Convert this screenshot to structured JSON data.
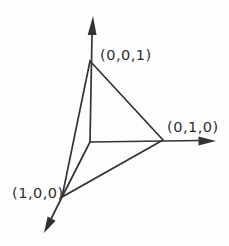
{
  "figure": {
    "background_color": "#fdfdfd",
    "line_color": "#333333",
    "points": [
      {
        "label": "(0,0,1)",
        "coords": [
          0,
          0,
          1
        ],
        "position": "top-vertex"
      },
      {
        "label": "(0,1,0)",
        "coords": [
          0,
          1,
          0
        ],
        "position": "right-vertex"
      },
      {
        "label": "(1,0,0)",
        "coords": [
          1,
          0,
          0
        ],
        "position": "bottom-left-vertex"
      }
    ],
    "axes": [
      {
        "name": "z-axis",
        "direction": "up"
      },
      {
        "name": "y-axis",
        "direction": "right"
      },
      {
        "name": "x-axis",
        "direction": "down-left"
      }
    ]
  }
}
